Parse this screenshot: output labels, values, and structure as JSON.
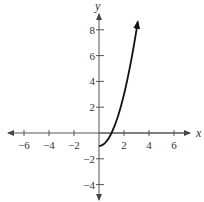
{
  "chart_data": {
    "type": "line",
    "title": "",
    "xlabel": "x",
    "ylabel": "y",
    "xlim": [
      -7,
      7
    ],
    "ylim": [
      -5,
      9
    ],
    "grid": false,
    "x_ticks": [
      -6,
      -4,
      -2,
      2,
      4,
      6
    ],
    "y_ticks": [
      -4,
      -2,
      2,
      4,
      6,
      8
    ],
    "x_tick_labels": [
      "−6",
      "−4",
      "−2",
      "2",
      "4",
      "6"
    ],
    "y_tick_labels": [
      "−4",
      "−2",
      "2",
      "4",
      "6",
      "8"
    ],
    "series": [
      {
        "name": "curve",
        "description": "y = x^2 - 1 for x >= 0, arrow at upper end",
        "x": [
          0,
          0.5,
          1,
          1.5,
          2,
          2.5,
          3,
          3.1
        ],
        "y": [
          -1,
          -0.75,
          0,
          1.25,
          3,
          5.25,
          8,
          8.6
        ],
        "color": "#111111",
        "start_point": [
          0,
          -1
        ],
        "end_arrow": true
      }
    ]
  },
  "axes": {
    "x_name": "x",
    "y_name": "y"
  },
  "colors": {
    "axis": "#555555",
    "curve": "#111111"
  }
}
